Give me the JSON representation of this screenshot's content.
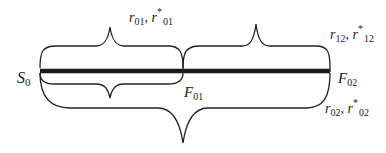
{
  "diagram": {
    "colors": {
      "ink": "#222222",
      "bar": "#1a1a1a",
      "background": "#ffffff"
    },
    "nodes": {
      "s0": {
        "main": "S",
        "sub": "0"
      },
      "f01": {
        "main": "F",
        "sub": "01"
      },
      "f02": {
        "main": "F",
        "sub": "02"
      }
    },
    "braces": {
      "top_left": {
        "r": "r",
        "r_sub": "01",
        "sep": ", ",
        "rstar": "r",
        "star": "*",
        "rstar_sub": "01"
      },
      "top_right": {
        "r": "r",
        "r_sub": "12",
        "sep": ", ",
        "rstar": "r",
        "star": "*",
        "rstar_sub": "12"
      },
      "bottom": {
        "r": "r",
        "r_sub": "02",
        "sep": ", ",
        "rstar": "r",
        "star": "*",
        "rstar_sub": "02"
      }
    }
  }
}
